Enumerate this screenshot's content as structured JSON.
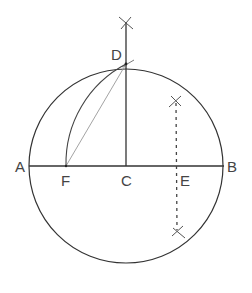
{
  "diagram": {
    "title": "",
    "colors": {
      "stroke": "#333333",
      "thin": "#888888",
      "label": "#444444"
    },
    "circle": {
      "cx": 126,
      "cy": 166,
      "r": 97
    },
    "points": {
      "A": {
        "label": "A",
        "x": 29,
        "y": 166
      },
      "B": {
        "label": "B",
        "x": 224,
        "y": 166
      },
      "C": {
        "label": "C",
        "x": 126,
        "y": 166
      },
      "D": {
        "label": "D",
        "x": 126,
        "y": 64
      },
      "E": {
        "label": "E",
        "x": 176,
        "y": 166
      },
      "F": {
        "label": "F",
        "x": 66,
        "y": 166
      }
    },
    "labels": {
      "A": "A",
      "B": "B",
      "C": "C",
      "D": "D",
      "E": "E",
      "F": "F"
    },
    "elements": [
      {
        "type": "segment",
        "from": "A",
        "to": "B",
        "desc": "diameter AB"
      },
      {
        "type": "segment",
        "from": "C",
        "to": [
          126,
          22
        ],
        "desc": "perpendicular CD extended"
      },
      {
        "type": "segment",
        "from": "F",
        "to": "D",
        "desc": "chord FD (thin)"
      },
      {
        "type": "arc",
        "center": "E",
        "from": "D",
        "to": "F",
        "desc": "arc DF centered at E"
      },
      {
        "type": "dashed",
        "from": [
          176,
          101
        ],
        "to": [
          176,
          232
        ],
        "desc": "perpendicular bisector through E"
      },
      {
        "type": "cross",
        "at": [
          126,
          23
        ]
      },
      {
        "type": "cross",
        "at": [
          175,
          101
        ]
      },
      {
        "type": "cross",
        "at": [
          178,
          232
        ]
      }
    ]
  }
}
